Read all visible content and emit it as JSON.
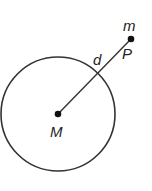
{
  "diagram": {
    "colors": {
      "stroke": "#333333",
      "point": "#111111",
      "text": "#222222",
      "background": "#ffffff"
    },
    "circle": {
      "cx": 58,
      "cy": 114,
      "r": 57,
      "label": "M"
    },
    "center_point": {
      "x": 58,
      "y": 114,
      "label": "M"
    },
    "outer_point": {
      "x": 131,
      "y": 39,
      "label": "P",
      "mass_label": "m"
    },
    "segment": {
      "label": "d"
    },
    "labels": {
      "M": "M",
      "P": "P",
      "m": "m",
      "d": "d"
    }
  }
}
